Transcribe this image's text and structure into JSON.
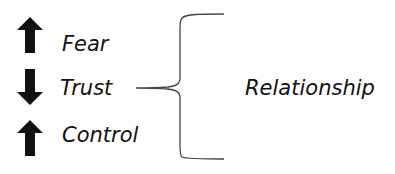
{
  "diagram": {
    "items": [
      {
        "label": "Fear",
        "direction": "up",
        "icon": "arrow-up-icon"
      },
      {
        "label": "Trust",
        "direction": "down",
        "icon": "arrow-down-icon"
      },
      {
        "label": "Control",
        "direction": "up",
        "icon": "arrow-up-icon"
      }
    ],
    "group_label": "Relationship",
    "colors": {
      "arrow": "#111111",
      "text": "#111111",
      "brace": "#444444"
    }
  }
}
